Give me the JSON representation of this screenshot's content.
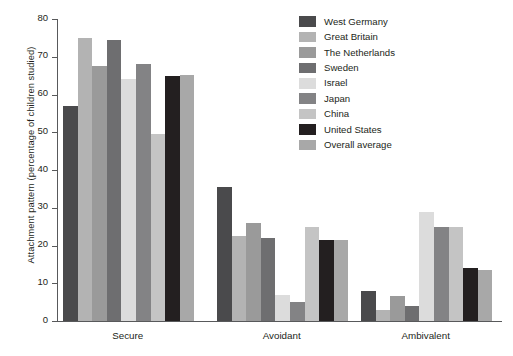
{
  "chart_data": {
    "type": "bar",
    "title": "",
    "xlabel": "",
    "ylabel": "Attachment pattern (percentage of children studied)",
    "ylim": [
      0,
      80
    ],
    "yticks": [
      0,
      10,
      20,
      30,
      40,
      50,
      60,
      70,
      80
    ],
    "grid": false,
    "legend_position": "top-right",
    "categories": [
      "Secure",
      "Avoidant",
      "Ambivalent"
    ],
    "series": [
      {
        "name": "West Germany",
        "color": "#4a4a4c",
        "values": [
          57.0,
          35.5,
          8.0
        ]
      },
      {
        "name": "Great Britain",
        "color": "#b3b3b3",
        "values": [
          75.0,
          22.5,
          3.0
        ]
      },
      {
        "name": "The Netherlands",
        "color": "#9a9a9a",
        "values": [
          67.5,
          26.0,
          6.5
        ]
      },
      {
        "name": "Sweden",
        "color": "#6e6e70",
        "values": [
          74.5,
          22.0,
          4.0
        ]
      },
      {
        "name": "Israel",
        "color": "#dcdcdc",
        "values": [
          64.0,
          7.0,
          29.0
        ]
      },
      {
        "name": "Japan",
        "color": "#838385",
        "values": [
          68.0,
          5.0,
          25.0
        ]
      },
      {
        "name": "China",
        "color": "#c4c4c4",
        "values": [
          49.5,
          25.0,
          25.0
        ]
      },
      {
        "name": "United States",
        "color": "#231f20",
        "values": [
          65.0,
          21.5,
          14.0
        ]
      },
      {
        "name": "Overall average",
        "color": "#a8a8a8",
        "values": [
          65.3,
          21.5,
          13.5
        ]
      }
    ]
  }
}
